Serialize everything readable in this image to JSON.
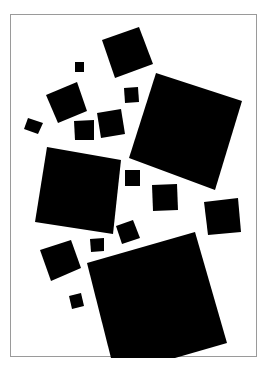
{
  "artwork": {
    "background_color": "#ffffff",
    "shape_color": "#000000",
    "frame_color": "#9a9a9a",
    "shapes": [
      {
        "id": "top-square",
        "points": "102,40 139,27 153,64 115,78"
      },
      {
        "id": "big-right-square",
        "points": "156,73 242,101 215,190 129,158"
      },
      {
        "id": "tiny-square-1",
        "points": "75,62 84,62 84,72 75,72"
      },
      {
        "id": "mid-left-square",
        "points": "46,95 77,82 87,111 58,123"
      },
      {
        "id": "small-left-square",
        "points": "28,118 43,123 38,134 24,129"
      },
      {
        "id": "small-square-a",
        "points": "74,121 94,120 94,140 75,140"
      },
      {
        "id": "small-square-b",
        "points": "97,113 121,109 125,134 101,138"
      },
      {
        "id": "small-square-c",
        "points": "124,88 138,87 139,102 125,103"
      },
      {
        "id": "big-left-square",
        "points": "47,147 121,160 113,234 35,222"
      },
      {
        "id": "small-square-d",
        "points": "125,170 140,170 140,186 125,186"
      },
      {
        "id": "small-square-e",
        "points": "152,185 177,184 178,210 153,211"
      },
      {
        "id": "right-square",
        "points": "204,202 238,198 241,232 208,235"
      },
      {
        "id": "small-rot-square",
        "points": "116,226 133,220 140,238 122,244"
      },
      {
        "id": "lower-left-square",
        "points": "40,250 71,240 81,268 51,281"
      },
      {
        "id": "small-square-f",
        "points": "90,239 104,238 104,251 91,252"
      },
      {
        "id": "tiny-square-2",
        "points": "69,296 81,293 84,306 72,309"
      },
      {
        "id": "big-bottom-square",
        "points": "87,263 195,232 227,343 175,358 111,358"
      }
    ]
  }
}
